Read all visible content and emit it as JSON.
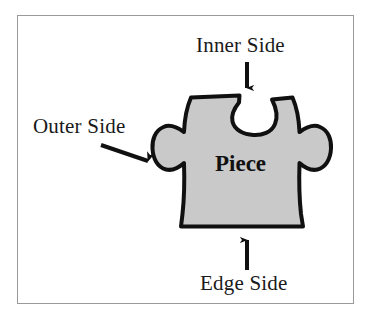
{
  "figure": {
    "type": "labelled-diagram",
    "background_color": "#ffffff",
    "frame_border_color": "#9a9a9a"
  },
  "piece": {
    "label": "Piece",
    "fill_color": "#c9c9c9",
    "outline_color": "#101010",
    "sides": {
      "top": "inner",
      "left": "outer",
      "right": "outer",
      "bottom": "edge"
    }
  },
  "annotations": [
    {
      "id": "inner-side",
      "label": "Inner Side",
      "arrow": "down",
      "points_to": "top-notch"
    },
    {
      "id": "outer-side",
      "label": "Outer Side",
      "arrow": "down-right",
      "points_to": "left-knob"
    },
    {
      "id": "edge-side",
      "label": "Edge Side",
      "arrow": "up",
      "points_to": "bottom-edge"
    }
  ],
  "colors": {
    "ink": "#1a1a1a",
    "piece_fill": "#c9c9c9",
    "piece_outline": "#101010",
    "frame": "#9a9a9a"
  }
}
